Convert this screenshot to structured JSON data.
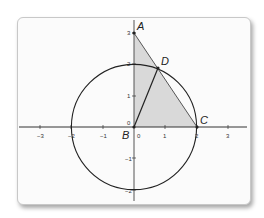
{
  "diagram": {
    "type": "coordinate-geometry",
    "origin_px": [
      134,
      127
    ],
    "unit_px": 31.3,
    "x_ticks": [
      "−3",
      "−2",
      "−1",
      "0",
      "1",
      "2",
      "3"
    ],
    "y_ticks": [
      "−2",
      "−1",
      "0",
      "1",
      "2",
      "3"
    ],
    "circle": {
      "center": [
        0,
        0
      ],
      "radius": 2
    },
    "points": {
      "A": {
        "label": "A",
        "coords": [
          0,
          3
        ]
      },
      "B": {
        "label": "B",
        "coords": [
          0,
          0
        ]
      },
      "C": {
        "label": "C",
        "coords": [
          2,
          0
        ]
      },
      "D": {
        "label": "D",
        "coords": [
          0.72,
          1.87
        ]
      }
    },
    "shaded_triangle": [
      "A",
      "B",
      "C"
    ],
    "segments": [
      [
        "A",
        "C"
      ],
      [
        "B",
        "D"
      ]
    ],
    "colors": {
      "shade": "#d9d9d9",
      "line": "#222222",
      "axis": "#333333",
      "card": "#fbfbfb"
    }
  }
}
